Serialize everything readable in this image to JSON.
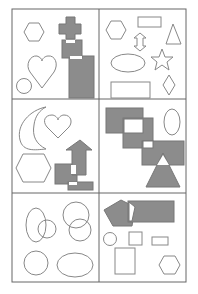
{
  "figure": {
    "width": 198,
    "height": 294,
    "grid": {
      "left": 12,
      "top": 9,
      "right": 186,
      "bottom": 282,
      "col_divider_x": 99,
      "row_divider_y": [
        99,
        193
      ],
      "stroke": "#666666"
    },
    "colors": {
      "fill": "#8c8c8c",
      "stroke": "#777777",
      "outline": "#888888",
      "background": "#ffffff"
    },
    "panels": [
      {
        "id": "top-left",
        "shapes": [
          "hexagon",
          "heart",
          "circle",
          "cross",
          "square",
          "rectangle"
        ]
      },
      {
        "id": "top-right",
        "shapes": [
          "hexagon",
          "rectangle",
          "double-arrow",
          "triangle",
          "ellipse",
          "star",
          "rectangle",
          "diamond"
        ]
      },
      {
        "id": "middle-left",
        "shapes": [
          "crescent",
          "heart",
          "hexagon",
          "arrow-up",
          "square",
          "rectangle"
        ]
      },
      {
        "id": "middle-right",
        "shapes": [
          "rectangle",
          "square",
          "rectangle",
          "ellipse",
          "triangle"
        ]
      },
      {
        "id": "bottom-left",
        "shapes": [
          "ellipse",
          "circle",
          "circle",
          "circle",
          "circle",
          "ellipse"
        ]
      },
      {
        "id": "bottom-right",
        "shapes": [
          "pentagon",
          "rectangle",
          "circle",
          "square",
          "rectangle",
          "rectangle",
          "hexagon"
        ]
      }
    ]
  }
}
